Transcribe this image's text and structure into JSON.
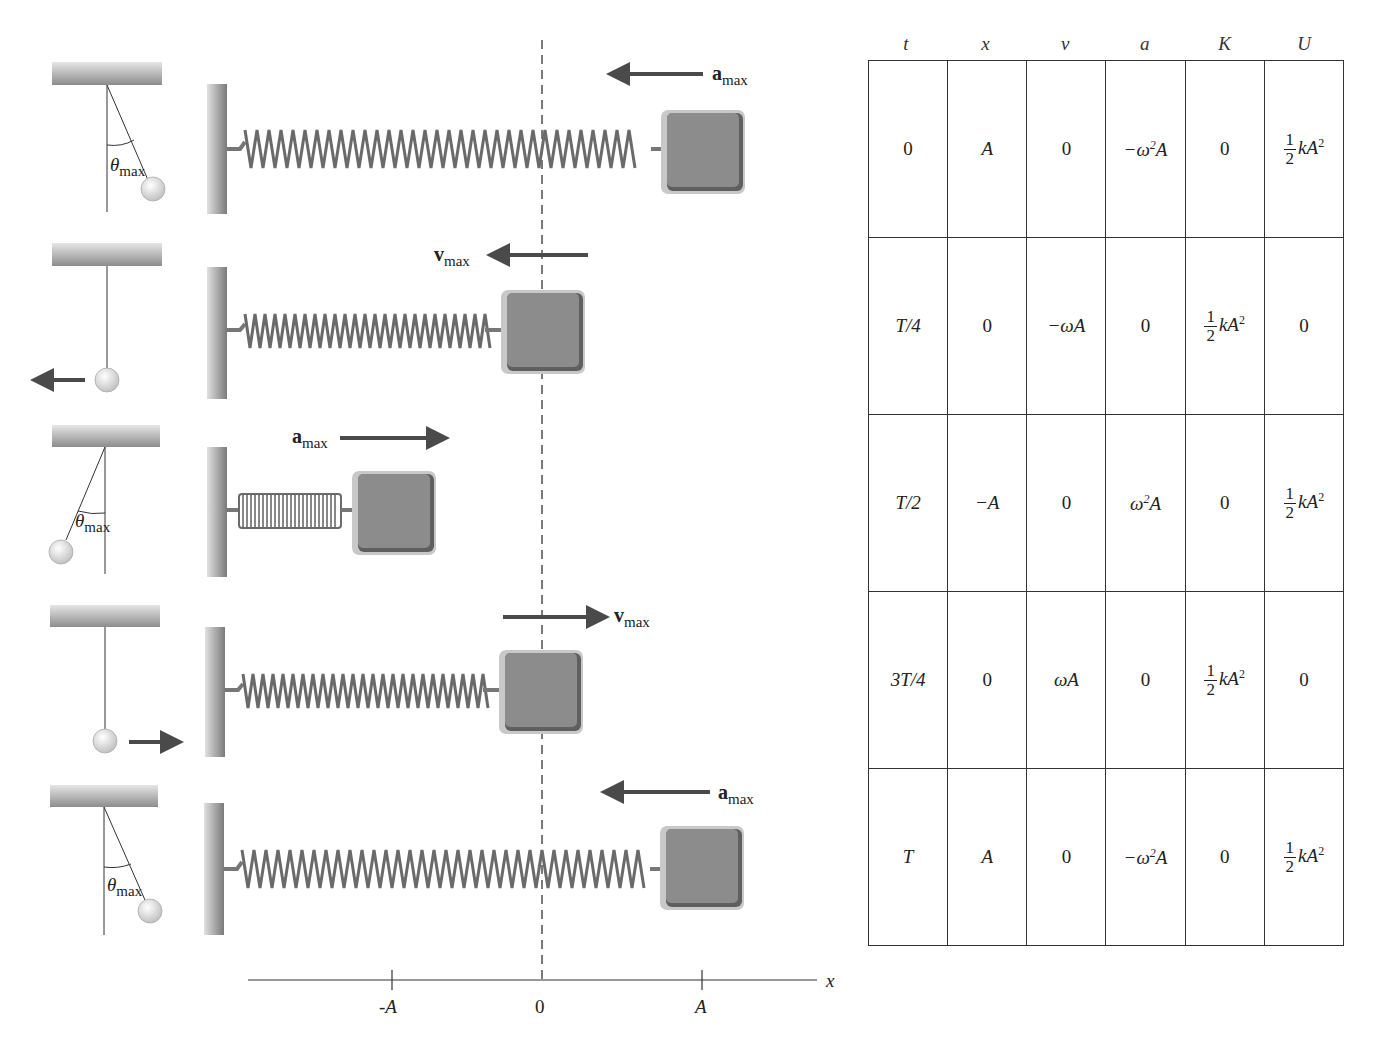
{
  "figure": {
    "rows": [
      {
        "time": "0",
        "pendulum_state": "left of vertical, at theta_max",
        "pendulum_label_main": "θ",
        "pendulum_label_sub": "max",
        "vector_label_main": "a",
        "vector_label_sub": "max",
        "vector_direction": "left",
        "block_position": "A"
      },
      {
        "time": "T/4",
        "pendulum_state": "at vertical, moving left",
        "vector_label_main": "v",
        "vector_label_sub": "max",
        "vector_direction": "left",
        "block_position": "0"
      },
      {
        "time": "T/2",
        "pendulum_state": "left side, at theta_max",
        "pendulum_label_main": "θ",
        "pendulum_label_sub": "max",
        "vector_label_main": "a",
        "vector_label_sub": "max",
        "vector_direction": "right",
        "block_position": "-A"
      },
      {
        "time": "3T/4",
        "pendulum_state": "at vertical, moving right",
        "vector_label_main": "v",
        "vector_label_sub": "max",
        "vector_direction": "right",
        "block_position": "0"
      },
      {
        "time": "T",
        "pendulum_state": "right of vertical, at theta_max",
        "pendulum_label_main": "θ",
        "pendulum_label_sub": "max",
        "vector_label_main": "a",
        "vector_label_sub": "max",
        "vector_direction": "left",
        "block_position": "A"
      }
    ],
    "axis": {
      "label": "x",
      "ticks": [
        "-A",
        "0",
        "A"
      ]
    }
  },
  "table": {
    "headers": [
      "t",
      "x",
      "v",
      "a",
      "K",
      "U"
    ],
    "rows": [
      {
        "t": "0",
        "x": "A",
        "v": "0",
        "a": "−ω²A",
        "K": "0",
        "U": "½kA²"
      },
      {
        "t": "T/4",
        "x": "0",
        "v": "−ωA",
        "a": "0",
        "K": "½kA²",
        "U": "0"
      },
      {
        "t": "T/2",
        "x": "−A",
        "v": "0",
        "a": "ω²A",
        "K": "0",
        "U": "½kA²"
      },
      {
        "t": "3T/4",
        "x": "0",
        "v": "ωA",
        "a": "0",
        "K": "½kA²",
        "U": "0"
      },
      {
        "t": "T",
        "x": "A",
        "v": "0",
        "a": "−ω²A",
        "K": "0",
        "U": "½kA²"
      }
    ],
    "fraction": {
      "num": "1",
      "den": "2",
      "rest": "kA",
      "exp": "2"
    }
  },
  "colors": {
    "block": "#8a8a8a",
    "block_light": "#bdbdbd",
    "block_dark": "#5e5e5e",
    "arrow": "#4a4a4a",
    "wall": "#9a9a9a",
    "line": "#333333"
  }
}
